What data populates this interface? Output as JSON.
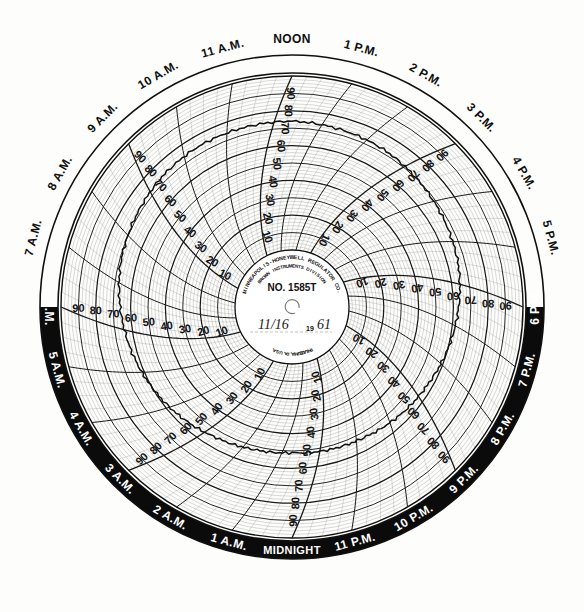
{
  "chart_data": {
    "type": "line",
    "subtitle": "Polar time-vs-value recorder chart, 24 hour rotation",
    "xlabel": "Time of Day",
    "ylabel": "Chart Scale",
    "grid": true,
    "legend": "none",
    "angular_axis": {
      "name": "Time of Day",
      "period_hours": 24,
      "start_at_top": "NOON",
      "direction": "clockwise",
      "tick_labels": [
        "NOON",
        "1 P.M.",
        "2 P.M.",
        "3 P.M.",
        "4 P.M.",
        "5 P.M.",
        "6 P.M.",
        "7 P.M.",
        "8 P.M.",
        "9 P.M.",
        "10 P.M.",
        "11 P.M.",
        "MIDNIGHT",
        "1 A.M.",
        "2 A.M.",
        "3 A.M.",
        "4 A.M.",
        "5 A.M.",
        "6 A.M.",
        "7 A.M.",
        "8 A.M.",
        "9 A.M.",
        "10 A.M.",
        "11 A.M."
      ]
    },
    "radial_axis": {
      "name": "Chart Scale",
      "ylim": [
        0,
        100
      ],
      "tick_labels": [
        "10",
        "20",
        "30",
        "40",
        "50",
        "60",
        "70",
        "80",
        "90"
      ],
      "tick_values": [
        10,
        20,
        30,
        40,
        50,
        60,
        70,
        80,
        90
      ],
      "direction": "increasing outward",
      "repeated_on_spokes": 8
    },
    "x": [
      "NOON",
      "1 P.M.",
      "2 P.M.",
      "3 P.M.",
      "4 P.M.",
      "5 P.M.",
      "6 P.M.",
      "7 P.M.",
      "8 P.M.",
      "9 P.M.",
      "10 P.M.",
      "11 P.M.",
      "MIDNIGHT",
      "1 A.M.",
      "2 A.M.",
      "3 A.M.",
      "4 A.M.",
      "5 A.M.",
      "6 A.M.",
      "7 A.M.",
      "8 A.M.",
      "9 A.M.",
      "10 A.M.",
      "11 A.M."
    ],
    "series": [
      {
        "name": "Recorded Pen Trace",
        "color": "#111111",
        "values": [
          74,
          73,
          72,
          70,
          68,
          66,
          63,
          60,
          57,
          55,
          53,
          52,
          51,
          52,
          54,
          57,
          60,
          63,
          66,
          69,
          71,
          73,
          74,
          74
        ]
      }
    ],
    "annotations": [
      "Pen trace is a fine jagged ink line with small step discontinuities at several hour lines."
    ]
  },
  "hours": [
    {
      "label": "NOON",
      "angle": 0,
      "night": false
    },
    {
      "label": "1 P.M.",
      "angle": 15,
      "night": false
    },
    {
      "label": "2 P.M.",
      "angle": 30,
      "night": false
    },
    {
      "label": "3 P.M.",
      "angle": 45,
      "night": false
    },
    {
      "label": "4 P.M.",
      "angle": 60,
      "night": false
    },
    {
      "label": "5 P.M.",
      "angle": 75,
      "night": false
    },
    {
      "label": "6 P.M.",
      "angle": 90,
      "night": true
    },
    {
      "label": "7 P.M.",
      "angle": 105,
      "night": true
    },
    {
      "label": "8 P.M.",
      "angle": 120,
      "night": true
    },
    {
      "label": "9 P.M.",
      "angle": 135,
      "night": true
    },
    {
      "label": "10 P.M.",
      "angle": 150,
      "night": true
    },
    {
      "label": "11 P.M.",
      "angle": 165,
      "night": true
    },
    {
      "label": "MIDNIGHT",
      "angle": 180,
      "night": true
    },
    {
      "label": "1 A.M.",
      "angle": 195,
      "night": true
    },
    {
      "label": "2 A.M.",
      "angle": 210,
      "night": true
    },
    {
      "label": "3 A.M.",
      "angle": 225,
      "night": true
    },
    {
      "label": "4 A.M.",
      "angle": 240,
      "night": true
    },
    {
      "label": "5 A.M.",
      "angle": 255,
      "night": true
    },
    {
      "label": "6 A.M.",
      "angle": 270,
      "night": true
    },
    {
      "label": "7 A.M.",
      "angle": 285,
      "night": false
    },
    {
      "label": "8 A.M.",
      "angle": 300,
      "night": false
    },
    {
      "label": "9 A.M.",
      "angle": 315,
      "night": false
    },
    {
      "label": "10 A.M.",
      "angle": 330,
      "night": false
    },
    {
      "label": "11 A.M.",
      "angle": 345,
      "night": false
    }
  ],
  "scale_numbers": [
    "10",
    "20",
    "30",
    "40",
    "50",
    "60",
    "70",
    "80",
    "90"
  ],
  "scale_spoke_angles": [
    0,
    45,
    90,
    135,
    180,
    225,
    270,
    315
  ],
  "hub": {
    "maker_line1": "MINNEAPOLIS-HONEYWELL REGULATOR CO.",
    "maker_line2": "BROWN INSTRUMENTS DIVISION",
    "chart_number": "NO. 1585T",
    "city": "PHILADELPHIA, PA. U.S.A.",
    "date_written": "11/16",
    "year_prefix": "19",
    "year_written": "61"
  },
  "colors": {
    "ink": "#101010",
    "paper": "#fdfdfb",
    "night_band": "#0b0b0b",
    "night_text": "#ffffff",
    "day_text": "#101010",
    "grid_major": "#1a1a1a",
    "grid_minor": "#555555",
    "trace": "#111111"
  }
}
